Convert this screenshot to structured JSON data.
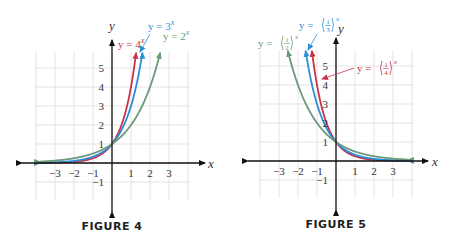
{
  "chart_data": [
    {
      "type": "line",
      "caption": "FIGURE 4",
      "xlabel": "x",
      "ylabel": "y",
      "xlim": [
        -4,
        4
      ],
      "ylim": [
        -2,
        6
      ],
      "grid": true,
      "x_ticks": [
        "−3",
        "−2",
        "−1",
        "1",
        "2",
        "3"
      ],
      "x_tick_values": [
        -3,
        -2,
        -1,
        1,
        2,
        3
      ],
      "y_ticks": [
        "5",
        "4",
        "3",
        "2",
        "1",
        "−1"
      ],
      "y_tick_values": [
        5,
        4,
        3,
        2,
        1,
        -1
      ],
      "series": [
        {
          "name": "y = 4^x",
          "label_main": "y = 4",
          "label_exp": "x",
          "base": 4,
          "color": "#c8324b"
        },
        {
          "name": "y = 3^x",
          "label_main": "y = 3",
          "label_exp": "x",
          "base": 3,
          "color": "#2b8fd8"
        },
        {
          "name": "y = 2^x",
          "label_main": "y = 2",
          "label_exp": "x",
          "base": 2,
          "color": "#6a9a78"
        }
      ]
    },
    {
      "type": "line",
      "caption": "FIGURE 5",
      "xlabel": "x",
      "ylabel": "y",
      "xlim": [
        -4,
        4
      ],
      "ylim": [
        -2,
        6
      ],
      "grid": true,
      "x_ticks": [
        "−3",
        "−2",
        "−1",
        "1",
        "2",
        "3"
      ],
      "x_tick_values": [
        -3,
        -2,
        -1,
        1,
        2,
        3
      ],
      "y_ticks": [
        "5",
        "4",
        "3",
        "2",
        "1",
        "−1"
      ],
      "y_tick_values": [
        5,
        4,
        3,
        2,
        1,
        -1
      ],
      "series": [
        {
          "name": "y = (1/4)^x",
          "label_main": "y = (",
          "label_num": "1",
          "label_den": "4",
          "label_exp": "x",
          "base": 0.25,
          "color": "#c8324b"
        },
        {
          "name": "y = (1/3)^x",
          "label_main": "y = (",
          "label_num": "1",
          "label_den": "3",
          "label_exp": "x",
          "base": 0.3333,
          "color": "#2b8fd8"
        },
        {
          "name": "y = (1/2)^x",
          "label_main": "y = (",
          "label_num": "1",
          "label_den": "2",
          "label_exp": "x",
          "base": 0.5,
          "color": "#6a9a78"
        }
      ]
    }
  ]
}
